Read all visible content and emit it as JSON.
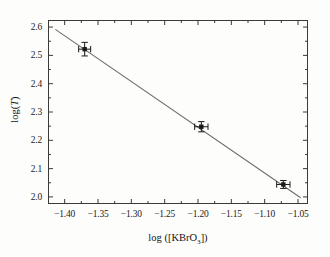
{
  "chart_data": {
    "type": "scatter",
    "title": "",
    "subtitle": "",
    "xlabel": "log ([KBrO3])",
    "xlabel_parts": {
      "prefix": "log ([KBrO",
      "sub": "3",
      "suffix": "])"
    },
    "ylabel": "log(T)",
    "ylabel_parts": {
      "prefix": "log(",
      "italic": "T",
      "suffix": ")"
    },
    "xlim": [
      -1.425,
      -1.035
    ],
    "ylim": [
      1.975,
      2.625
    ],
    "xticks": [
      -1.4,
      -1.35,
      -1.3,
      -1.25,
      -1.2,
      -1.15,
      -1.1,
      -1.05
    ],
    "xtick_labels": [
      "−1.40",
      "−1.35",
      "−1.30",
      "−1.25",
      "−1.20",
      "−1.15",
      "−1.10",
      "−1.05"
    ],
    "yticks": [
      2.0,
      2.1,
      2.2,
      2.3,
      2.4,
      2.5,
      2.6
    ],
    "ytick_labels": [
      "2.0",
      "2.1",
      "2.2",
      "2.3",
      "2.4",
      "2.5",
      "2.6"
    ],
    "x_minor_ticks": [
      -1.375,
      -1.325,
      -1.275,
      -1.225,
      -1.175,
      -1.125,
      -1.075
    ],
    "y_minor_ticks": [
      2.05,
      2.15,
      2.25,
      2.35,
      2.45,
      2.55
    ],
    "grid": false,
    "legend": null,
    "tick_direction": "in",
    "marker": "filled-square",
    "marker_color": "#1a1a1a",
    "line_color": "#6d6d6d",
    "points": [
      {
        "x": -1.37,
        "y": 2.522,
        "xerr": 0.009,
        "yerr": 0.024
      },
      {
        "x": -1.195,
        "y": 2.248,
        "xerr": 0.01,
        "yerr": 0.018
      },
      {
        "x": -1.072,
        "y": 2.044,
        "xerr": 0.01,
        "yerr": 0.014
      }
    ],
    "fit_line": {
      "x_start": -1.414,
      "y_start": 2.592,
      "x_end": -1.046,
      "y_end": 1.997,
      "slope": -1.617,
      "intercept": 0.305
    }
  },
  "colors": {
    "background": "#fdfdfc",
    "frame": "#3a3a3a",
    "text": "#1c1c1c",
    "marker": "#1a1a1a",
    "fit_line": "#6d6d6d"
  }
}
